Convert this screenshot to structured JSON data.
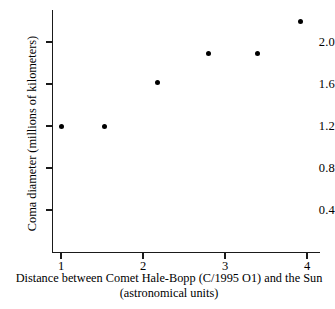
{
  "chart_data": {
    "type": "scatter",
    "title": "",
    "xlabel": "Distance between Comet Hale-Bopp (C/1995 O1) and the Sun (astronomical units)",
    "xlabel_line1": "Distance between Comet Hale-Bopp (C/1995 O1) and the Sun",
    "xlabel_line2": "(astronomical units)",
    "ylabel": "Coma diameter (millions of kilometers)",
    "xlim": [
      0.62,
      4.22
    ],
    "ylim": [
      0.0,
      2.33
    ],
    "grid": false,
    "legend": null,
    "xticks": [
      1,
      2,
      3,
      4
    ],
    "xticklabels": [
      "1",
      "2",
      "3",
      "4"
    ],
    "yticks": [
      0.4,
      0.8,
      1.2,
      1.6,
      2.0
    ],
    "yticklabels": [
      "0.4",
      "0.8",
      "1.2",
      "1.6",
      "2.0"
    ],
    "marker": "filled-circle",
    "marker_color": "#000000",
    "points": [
      {
        "x": 1.0,
        "y": 1.2
      },
      {
        "x": 1.53,
        "y": 1.2
      },
      {
        "x": 2.18,
        "y": 1.61
      },
      {
        "x": 2.8,
        "y": 1.89
      },
      {
        "x": 3.4,
        "y": 1.89
      },
      {
        "x": 3.92,
        "y": 2.2
      }
    ]
  }
}
